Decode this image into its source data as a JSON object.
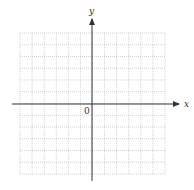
{
  "diagram": {
    "type": "coordinate-plane",
    "x_axis_label": "x",
    "y_axis_label": "y",
    "origin_label": "0",
    "grid": {
      "columns": 12,
      "rows": 12,
      "style": "dotted"
    },
    "colors": {
      "axis": "#333333",
      "grid": "#c8c8c8",
      "background": "#ffffff"
    }
  }
}
